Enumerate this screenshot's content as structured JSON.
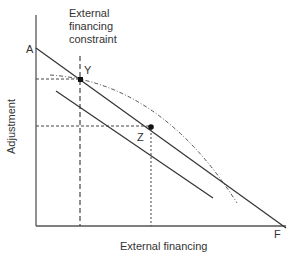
{
  "diagram": {
    "axes": {
      "y_label": "Adjustment",
      "x_label": "External financing"
    },
    "constraint_label": [
      "External",
      "financing",
      "constraint"
    ],
    "points": {
      "A": "A",
      "F": "F",
      "Y": "Y",
      "Z": "Z"
    },
    "colors": {
      "line": "#333333",
      "dashed": "#444444"
    }
  }
}
